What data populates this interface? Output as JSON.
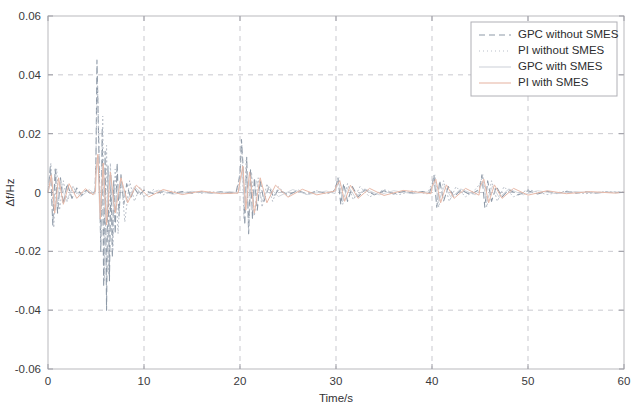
{
  "chart_data": {
    "type": "line",
    "title": "",
    "xlabel": "Time/s",
    "ylabel": "Δf/Hz",
    "xlim": [
      0,
      60
    ],
    "ylim": [
      -0.06,
      0.06
    ],
    "xticks": [
      0,
      10,
      20,
      30,
      40,
      50,
      60
    ],
    "xtick_labels": [
      "0",
      "10",
      "20",
      "30",
      "40",
      "50",
      "60"
    ],
    "yticks": [
      -0.06,
      -0.04,
      -0.02,
      0,
      0.02,
      0.04,
      0.06
    ],
    "ytick_labels": [
      "-0.06",
      "-0.04",
      "-0.02",
      "0",
      "0.02",
      "0.04",
      "0.06"
    ],
    "grid": true,
    "grid_style": "dashed",
    "legend_position": "top-right",
    "legend_entries": [
      {
        "label": "GPC without SMES",
        "color": "#8e9aa8",
        "dash": "6 4",
        "width": 1.1
      },
      {
        "label": "PI without SMES",
        "color": "#b9bfc9",
        "dash": "1 3",
        "width": 1.0
      },
      {
        "label": "GPC with SMES",
        "color": "#cfd4da",
        "dash": "0",
        "width": 0.9
      },
      {
        "label": "PI with SMES",
        "color": "#e8b9a8",
        "dash": "0",
        "width": 0.9
      }
    ],
    "series": [
      {
        "name": "GPC without SMES",
        "color": "#8e9aa8",
        "dash": "6 4",
        "width": 1.1,
        "x": [
          0,
          0.25,
          0.5,
          0.75,
          1,
          1.3,
          1.6,
          2,
          2.5,
          3,
          3.5,
          4,
          4.5,
          4.9,
          5,
          5.1,
          5.2,
          5.35,
          5.5,
          5.65,
          5.8,
          5.95,
          6.1,
          6.25,
          6.4,
          6.55,
          6.7,
          6.85,
          7,
          7.2,
          7.4,
          7.6,
          7.9,
          8.2,
          8.6,
          9,
          9.5,
          10,
          11,
          12,
          13,
          14,
          15,
          16,
          17,
          18,
          19,
          19.6,
          20,
          20.15,
          20.3,
          20.5,
          20.7,
          20.9,
          21.1,
          21.3,
          21.5,
          21.8,
          22.1,
          22.5,
          23,
          23.5,
          24,
          25,
          26,
          27,
          28,
          29,
          29.7,
          30,
          30.2,
          30.5,
          30.8,
          31.2,
          31.7,
          32.3,
          33,
          34,
          35,
          36,
          37,
          38,
          39,
          39.7,
          40,
          40.2,
          40.5,
          40.8,
          41.2,
          41.7,
          42.3,
          43,
          44,
          44.7,
          45,
          45.2,
          45.5,
          45.8,
          46.2,
          46.7,
          47.3,
          48,
          49,
          50,
          51,
          52,
          53,
          54,
          55,
          56,
          57,
          58,
          59,
          60
        ],
        "y": [
          0,
          0.009,
          -0.011,
          0.008,
          -0.007,
          0.005,
          -0.004,
          0.003,
          -0.002,
          0.0015,
          -0.001,
          0.0008,
          -0.0006,
          0.0004,
          0.012,
          0.045,
          0.03,
          0.006,
          -0.02,
          0.022,
          -0.032,
          0.014,
          -0.04,
          0.009,
          -0.03,
          0.006,
          -0.022,
          0.004,
          -0.014,
          0.01,
          -0.008,
          0.006,
          -0.004,
          0.003,
          -0.002,
          0.0015,
          -0.001,
          0.0008,
          -0.0005,
          0.0004,
          -0.0003,
          0.0003,
          -0.0002,
          0.0002,
          -0.0002,
          0.0002,
          -0.0002,
          0.0002,
          0.006,
          0.018,
          0.01,
          -0.011,
          0.012,
          -0.014,
          0.008,
          -0.009,
          0.005,
          -0.006,
          0.004,
          -0.003,
          0.002,
          -0.0015,
          0.001,
          -0.0008,
          0.0006,
          -0.0005,
          0.0004,
          -0.0003,
          0.0003,
          0.002,
          0.005,
          -0.004,
          0.003,
          -0.003,
          0.002,
          -0.0015,
          0.001,
          -0.0008,
          0.0006,
          -0.0005,
          0.0004,
          -0.0003,
          0.0003,
          -0.0002,
          0.002,
          0.006,
          -0.005,
          0.004,
          -0.003,
          0.002,
          -0.0015,
          0.001,
          -0.0008,
          0.0006,
          0.002,
          0.006,
          -0.005,
          0.004,
          -0.003,
          0.002,
          -0.0015,
          0.001,
          -0.0008,
          0.0006,
          -0.0005,
          0.0004,
          -0.0003,
          0.0003,
          -0.0002,
          0.0002,
          -0.0002,
          0.0002,
          -0.0001,
          0.0001
        ]
      },
      {
        "name": "PI without SMES",
        "color": "#b9bfc9",
        "dash": "1 3",
        "width": 1.0,
        "x": [
          0,
          0.3,
          0.6,
          0.9,
          1.2,
          1.6,
          2,
          2.6,
          3.2,
          4,
          4.6,
          4.9,
          5,
          5.15,
          5.3,
          5.5,
          5.7,
          5.9,
          6.1,
          6.3,
          6.5,
          6.75,
          7,
          7.3,
          7.6,
          8,
          8.5,
          9,
          9.6,
          10,
          11,
          12,
          13,
          14,
          15,
          16,
          17,
          18,
          19,
          19.7,
          20,
          20.2,
          20.4,
          20.65,
          20.9,
          21.2,
          21.5,
          21.9,
          22.3,
          22.8,
          23.4,
          24,
          25,
          26,
          27,
          28,
          29,
          29.8,
          30,
          30.3,
          30.7,
          31.2,
          31.8,
          32.5,
          33.5,
          35,
          36.5,
          38,
          39.5,
          40,
          40.3,
          40.7,
          41.2,
          41.8,
          42.5,
          43.5,
          44.5,
          45,
          45.3,
          45.7,
          46.2,
          46.8,
          47.5,
          48.5,
          50,
          52,
          54,
          56,
          58,
          60
        ],
        "y": [
          0,
          0.01,
          -0.012,
          0.008,
          -0.006,
          0.004,
          -0.003,
          0.002,
          -0.0015,
          0.001,
          -0.0008,
          0.0005,
          0.014,
          0.038,
          0.018,
          -0.018,
          0.026,
          -0.03,
          0.016,
          -0.028,
          0.01,
          -0.02,
          0.008,
          -0.014,
          0.006,
          -0.01,
          0.004,
          -0.003,
          0.002,
          -0.0015,
          0.001,
          -0.0008,
          0.0006,
          -0.0005,
          0.0004,
          -0.0003,
          0.0003,
          -0.0002,
          0.0002,
          -0.0002,
          0.007,
          0.016,
          -0.009,
          0.011,
          -0.013,
          0.007,
          -0.008,
          0.005,
          -0.005,
          0.003,
          -0.003,
          0.002,
          -0.0015,
          0.001,
          -0.0008,
          0.0006,
          -0.0005,
          0.0004,
          0.003,
          0.005,
          -0.004,
          0.003,
          -0.0025,
          0.002,
          -0.0015,
          0.001,
          -0.0008,
          0.0006,
          -0.0005,
          0.003,
          0.006,
          -0.005,
          0.004,
          -0.003,
          0.002,
          -0.0015,
          0.001,
          0.003,
          0.006,
          -0.005,
          0.004,
          -0.003,
          0.002,
          -0.0015,
          0.001,
          -0.0007,
          0.0005,
          -0.0004,
          0.0003,
          0.0002
        ]
      },
      {
        "name": "GPC with SMES",
        "color": "#cfd4da",
        "dash": "0",
        "width": 0.9,
        "x": [
          0,
          0.4,
          0.8,
          1.3,
          1.9,
          2.6,
          3.4,
          4.3,
          4.9,
          5,
          5.2,
          5.4,
          5.7,
          6,
          6.4,
          6.9,
          7.5,
          8.2,
          9,
          10,
          11.5,
          13,
          15,
          17,
          19,
          19.8,
          20,
          20.25,
          20.5,
          20.8,
          21.2,
          21.7,
          22.3,
          23,
          24,
          25.5,
          27,
          29,
          29.9,
          30,
          30.3,
          30.7,
          31.3,
          32,
          33,
          34.5,
          36,
          38,
          39.9,
          40,
          40.3,
          40.7,
          41.3,
          42,
          43,
          44.5,
          44.9,
          45,
          45.3,
          45.7,
          46.3,
          47,
          48,
          49.5,
          51,
          53,
          55,
          57,
          59,
          60
        ],
        "y": [
          0,
          0.005,
          -0.006,
          0.004,
          -0.003,
          0.002,
          -0.0015,
          0.001,
          -0.0006,
          0.006,
          0.011,
          -0.008,
          0.009,
          -0.01,
          0.006,
          -0.006,
          0.004,
          -0.003,
          0.002,
          -0.0012,
          0.0008,
          -0.0006,
          0.0004,
          -0.0003,
          0.0003,
          -0.0002,
          0.003,
          0.007,
          -0.005,
          0.006,
          -0.006,
          0.004,
          -0.003,
          0.002,
          -0.0014,
          0.001,
          -0.0007,
          0.0005,
          -0.0004,
          0.0015,
          0.003,
          -0.0025,
          0.002,
          -0.0016,
          0.0012,
          -0.0008,
          0.0006,
          -0.0004,
          0.0003,
          0.0015,
          0.0035,
          -0.003,
          0.0022,
          -0.0017,
          0.0012,
          -0.0008,
          0.0006,
          0.0015,
          0.0035,
          -0.003,
          0.0022,
          -0.0017,
          0.0012,
          -0.0008,
          0.0006,
          -0.0004,
          0.0003,
          -0.0002,
          0.0002,
          0.0001
        ]
      },
      {
        "name": "PI with SMES",
        "color": "#e8b9a8",
        "dash": "0",
        "width": 1.0,
        "x": [
          0,
          0.35,
          0.7,
          1.1,
          1.6,
          2.2,
          3,
          3.9,
          4.7,
          4.95,
          5,
          5.2,
          5.45,
          5.75,
          6.1,
          6.5,
          7,
          7.6,
          8.3,
          9.2,
          10.5,
          12,
          14,
          16,
          18,
          19.8,
          20,
          20.3,
          20.6,
          21,
          21.5,
          22.1,
          22.8,
          23.7,
          25,
          26.5,
          28,
          29.9,
          30,
          30.4,
          30.9,
          31.5,
          32.3,
          33.5,
          35,
          37,
          39.9,
          40,
          40.4,
          40.9,
          41.5,
          42.3,
          43.5,
          44.9,
          45,
          45.4,
          45.9,
          46.5,
          47.3,
          48.5,
          50,
          52,
          54,
          56.5,
          59,
          60
        ],
        "y": [
          0,
          0.006,
          -0.007,
          0.005,
          -0.004,
          0.003,
          -0.002,
          0.0013,
          -0.0008,
          0.0005,
          0.007,
          0.013,
          -0.009,
          0.01,
          -0.011,
          0.007,
          -0.007,
          0.005,
          -0.0035,
          0.0025,
          -0.0015,
          0.001,
          -0.0007,
          0.0005,
          -0.0004,
          -0.0002,
          0.004,
          0.009,
          -0.006,
          0.007,
          -0.007,
          0.005,
          -0.0035,
          0.0025,
          -0.0016,
          0.0011,
          -0.0008,
          0.0005,
          0.002,
          0.004,
          -0.003,
          0.0025,
          -0.002,
          0.0014,
          -0.001,
          0.0007,
          -0.0004,
          0.002,
          0.0045,
          -0.0035,
          0.0026,
          -0.002,
          0.0014,
          -0.0009,
          0.002,
          0.0045,
          -0.0035,
          0.0026,
          -0.002,
          0.0014,
          -0.0009,
          0.0006,
          -0.0004,
          0.0003,
          -0.0002,
          0.0001
        ]
      }
    ]
  }
}
